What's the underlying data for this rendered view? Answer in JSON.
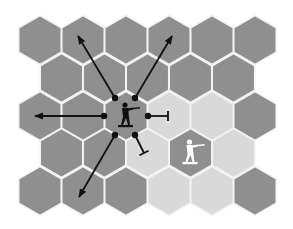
{
  "diagram": {
    "type": "hex-grid-movement-diagram",
    "colors": {
      "background": "#ffffff",
      "hex_dark": "#8f8f8f",
      "hex_light": "#d9d9d9",
      "hex_border": "#f2f2f2",
      "arrow": "#111111",
      "unit_dark": "#111111",
      "unit_light": "#ffffff"
    },
    "grid": {
      "orientation": "pointy-top",
      "rows": [
        {
          "row": 0,
          "cells": [
            "dark",
            "dark",
            "dark",
            "dark",
            "dark",
            "dark"
          ]
        },
        {
          "row": 1,
          "cells": [
            "dark",
            "dark",
            "dark",
            "dark",
            "dark"
          ]
        },
        {
          "row": 2,
          "cells": [
            "dark",
            "dark",
            "dark-selected",
            "light",
            "light",
            "dark"
          ]
        },
        {
          "row": 3,
          "cells": [
            "dark",
            "dark",
            "light",
            "dark-enemy",
            "light"
          ]
        },
        {
          "row": 4,
          "cells": [
            "dark",
            "dark",
            "dark",
            "light",
            "light",
            "dark"
          ]
        }
      ]
    },
    "units": [
      {
        "name": "player-soldier",
        "color": "black",
        "pose": "aiming-rifle",
        "hex": [
          2,
          2
        ]
      },
      {
        "name": "enemy-soldier",
        "color": "white",
        "pose": "aiming-rifle",
        "hex": [
          3,
          3
        ]
      }
    ],
    "directions": [
      {
        "name": "up-left",
        "type": "arrow",
        "open": true
      },
      {
        "name": "up-right",
        "type": "arrow",
        "open": true
      },
      {
        "name": "left",
        "type": "arrow",
        "open": true
      },
      {
        "name": "down-left",
        "type": "arrow",
        "open": true
      },
      {
        "name": "right",
        "type": "blocked",
        "open": false
      },
      {
        "name": "down-right",
        "type": "blocked",
        "open": false
      }
    ]
  }
}
